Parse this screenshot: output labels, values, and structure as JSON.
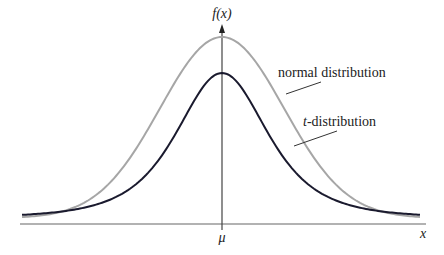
{
  "chart_data": {
    "type": "line",
    "title": "",
    "xlabel": "x",
    "ylabel": "f(x)",
    "x_ticks": [
      "μ"
    ],
    "grid": false,
    "legend": "inline annotations with leader lines",
    "series": [
      {
        "name": "normal distribution",
        "color": "#a6a6a6",
        "description": "taller, narrower bell curve centered at μ with thin tails",
        "peak_relative_height": 1.0
      },
      {
        "name": "t-distribution",
        "color": "#1a1a2e",
        "description": "lower peak centered at μ with heavier tails",
        "peak_relative_height": 0.81
      }
    ],
    "annotations": [
      {
        "text": "normal distribution",
        "points_to": "normal distribution curve"
      },
      {
        "text": "t-distribution",
        "points_to": "t-distribution curve"
      }
    ]
  },
  "labels": {
    "y_axis": "f(x)",
    "x_axis": "x",
    "center_tick": "μ",
    "normal": "normal distribution",
    "t_prefix": "t",
    "t_suffix": "-distribution"
  },
  "colors": {
    "normal": "#a6a6a6",
    "t": "#1a1a2e",
    "axis": "#555555"
  }
}
